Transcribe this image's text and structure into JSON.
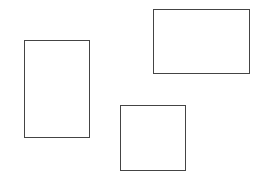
{
  "canvas": {
    "width": 261,
    "height": 183,
    "background": "#ffffff"
  },
  "stroke_color": "#444444",
  "shapes": [
    {
      "id": "left-rectangle",
      "type": "rectangle",
      "x": 24,
      "y": 40,
      "width": 66,
      "height": 98
    },
    {
      "id": "top-right-rectangle",
      "type": "rectangle",
      "x": 153,
      "y": 9,
      "width": 97,
      "height": 65
    },
    {
      "id": "bottom-middle-rectangle",
      "type": "rectangle",
      "x": 120,
      "y": 105,
      "width": 66,
      "height": 66
    }
  ]
}
